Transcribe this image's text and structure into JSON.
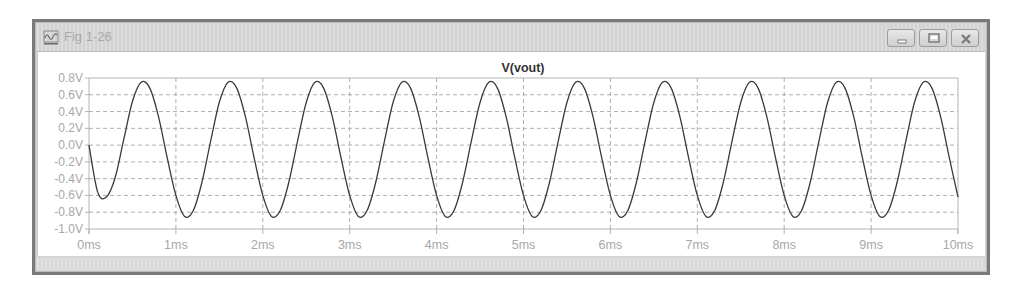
{
  "window": {
    "title": "Fig 1-26",
    "icon": "waveform-viewer-icon",
    "controls": {
      "minimize": "minimize-icon",
      "maximize": "maximize-icon",
      "close": "close-icon"
    }
  },
  "colors": {
    "trace": "#3a3a3a",
    "grid": "#9a9a9a",
    "axis_text": "#a8a8a8",
    "title": "#333333"
  },
  "chart_data": {
    "type": "line",
    "title": "V(vout)",
    "xlabel": "",
    "ylabel": "",
    "xlim": [
      0,
      10
    ],
    "ylim": [
      -1.0,
      0.8
    ],
    "x_unit": "ms",
    "y_unit": "V",
    "grid": true,
    "legend": null,
    "x_ticks": [
      "0ms",
      "1ms",
      "2ms",
      "3ms",
      "4ms",
      "5ms",
      "6ms",
      "7ms",
      "8ms",
      "9ms",
      "10ms"
    ],
    "y_ticks": [
      "0.8V",
      "0.6V",
      "0.4V",
      "0.2V",
      "0.0V",
      "-0.2V",
      "-0.4V",
      "-0.6V",
      "-0.8V",
      "-1.0V"
    ],
    "series": [
      {
        "name": "V(vout)",
        "x": [
          0.0,
          0.1,
          0.2,
          0.3,
          0.4,
          0.5,
          0.6,
          0.7,
          0.8,
          0.9,
          1.0,
          1.1,
          1.2,
          1.3,
          1.4,
          1.5,
          1.6,
          1.7,
          1.8,
          1.9,
          2.0,
          2.1,
          2.2,
          2.3,
          2.4,
          2.5,
          2.6,
          2.7,
          2.8,
          2.9,
          3.0,
          3.1,
          3.2,
          3.3,
          3.4,
          3.5,
          3.6,
          3.7,
          3.8,
          3.9,
          4.0,
          4.1,
          4.2,
          4.3,
          4.4,
          4.5,
          4.6,
          4.7,
          4.8,
          4.9,
          5.0,
          5.1,
          5.2,
          5.3,
          5.4,
          5.5,
          5.6,
          5.7,
          5.8,
          5.9,
          6.0,
          6.1,
          6.2,
          6.3,
          6.4,
          6.5,
          6.6,
          6.7,
          6.8,
          6.9,
          7.0,
          7.1,
          7.2,
          7.3,
          7.4,
          7.5,
          7.6,
          7.7,
          7.8,
          7.9,
          8.0,
          8.1,
          8.2,
          8.3,
          8.4,
          8.5,
          8.6,
          8.7,
          8.8,
          8.9,
          9.0,
          9.1,
          9.2,
          9.3,
          9.4,
          9.5,
          9.6,
          9.7,
          9.8,
          9.9,
          10.0
        ],
        "values": [
          0.0,
          -0.56,
          -0.62,
          -0.39,
          0.07,
          0.52,
          0.75,
          0.68,
          0.34,
          -0.15,
          -0.6,
          -0.85,
          -0.78,
          -0.44,
          0.05,
          0.51,
          0.75,
          0.68,
          0.34,
          -0.15,
          -0.6,
          -0.85,
          -0.78,
          -0.44,
          0.05,
          0.51,
          0.75,
          0.68,
          0.34,
          -0.15,
          -0.6,
          -0.85,
          -0.78,
          -0.44,
          0.05,
          0.51,
          0.75,
          0.68,
          0.34,
          -0.15,
          -0.6,
          -0.85,
          -0.78,
          -0.44,
          0.05,
          0.51,
          0.75,
          0.68,
          0.34,
          -0.15,
          -0.6,
          -0.85,
          -0.78,
          -0.44,
          0.05,
          0.51,
          0.75,
          0.68,
          0.34,
          -0.15,
          -0.6,
          -0.85,
          -0.78,
          -0.44,
          0.05,
          0.51,
          0.75,
          0.68,
          0.34,
          -0.15,
          -0.6,
          -0.85,
          -0.78,
          -0.44,
          0.05,
          0.51,
          0.75,
          0.68,
          0.34,
          -0.15,
          -0.6,
          -0.85,
          -0.78,
          -0.44,
          0.05,
          0.51,
          0.75,
          0.68,
          0.34,
          -0.15,
          -0.6,
          -0.85,
          -0.78,
          -0.44,
          0.05,
          0.51,
          0.75,
          0.68,
          0.34,
          -0.15,
          -0.62
        ]
      }
    ]
  }
}
